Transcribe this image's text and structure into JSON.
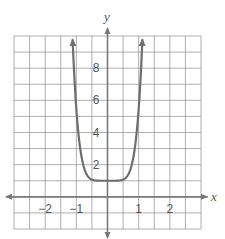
{
  "chart_data": {
    "type": "line",
    "title": "",
    "xlabel": "x",
    "ylabel": "y",
    "xlim": [
      -3,
      3
    ],
    "ylim": [
      -2,
      10
    ],
    "grid": true,
    "grid_step": {
      "x": 0.5,
      "y": 1
    },
    "x_ticks": [
      {
        "value": -2,
        "label": "−2"
      },
      {
        "value": -1,
        "label": "−1"
      },
      {
        "value": 1,
        "label": "1"
      },
      {
        "value": 2,
        "label": "2"
      }
    ],
    "y_ticks": [
      {
        "value": 2,
        "label": "2"
      },
      {
        "value": 4,
        "label": "4"
      },
      {
        "value": 6,
        "label": "6"
      },
      {
        "value": 8,
        "label": "8"
      }
    ],
    "series": [
      {
        "name": "f(x)",
        "description": "even-degree polynomial-like curve, minimum plateau at y = 1, rising steeply near x = ±1 with arrows at both ends",
        "x": [
          -1.12,
          -1.0,
          -0.9,
          -0.8,
          -0.7,
          -0.6,
          -0.5,
          -0.4,
          -0.2,
          0,
          0.2,
          0.4,
          0.5,
          0.6,
          0.7,
          0.8,
          0.9,
          1.0,
          1.12
        ],
        "y": [
          9.8,
          7.0,
          4.7,
          3.3,
          2.1,
          1.42,
          1.14,
          1.04,
          1.0,
          1.0,
          1.0,
          1.04,
          1.14,
          1.42,
          2.1,
          3.3,
          4.7,
          7.0,
          9.8
        ],
        "min_point": {
          "x": 0,
          "y": 1
        },
        "end_arrows": true
      }
    ],
    "colors": {
      "grid": "#9a9a9a",
      "axis": "#777777",
      "curve": "#6e6e6e",
      "text": "#555555"
    }
  }
}
